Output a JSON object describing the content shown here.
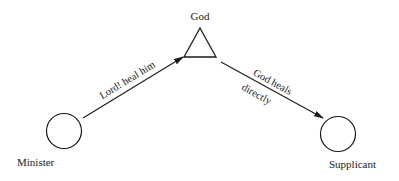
{
  "diagram": {
    "nodes": [
      {
        "id": "god",
        "label": "God",
        "shape": "triangle"
      },
      {
        "id": "minister",
        "label": "Minister",
        "shape": "circle"
      },
      {
        "id": "supplicant",
        "label": "Supplicant",
        "shape": "circle"
      }
    ],
    "edges": [
      {
        "from": "minister",
        "to": "god",
        "label": "Lord! heal him"
      },
      {
        "from": "god",
        "to": "supplicant",
        "label_line1": "God heals",
        "label_line2": "directly"
      }
    ],
    "colors": {
      "stroke": "#1a1a1a",
      "background": "#ffffff"
    }
  }
}
